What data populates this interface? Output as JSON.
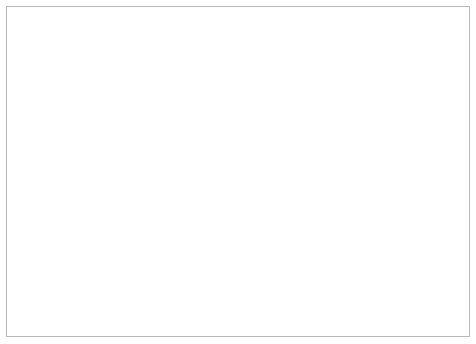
{
  "chart_data": {
    "type": "line",
    "title": "Anteil* in %",
    "xlabel": "",
    "ylabel": "",
    "ylim": [
      0,
      70
    ],
    "ytick_values": [
      0,
      10,
      20,
      30,
      40,
      50,
      60,
      70
    ],
    "xtick_labels": [
      "2003",
      "2004",
      "2005",
      "2006",
      "2007",
      "2008",
      "2009",
      "2010",
      "2011"
    ],
    "xlim": [
      2003.0,
      2011.5
    ],
    "grid": "horizontal",
    "legend": "none",
    "marker": "open-diamond",
    "line_color": "#000000",
    "grid_color": "#555555",
    "series": [
      {
        "name": "Anteil in %",
        "x": [
          2003.45,
          2003.7,
          2003.95,
          2004.2,
          2004.45,
          2004.7,
          2004.95,
          2005.2,
          2005.45,
          2005.7,
          2005.95,
          2006.2,
          2006.45,
          2006.7,
          2006.95,
          2007.2,
          2007.45,
          2007.7,
          2007.95,
          2008.2,
          2008.45,
          2008.7,
          2008.95,
          2009.05,
          2009.14,
          2009.23,
          2009.32,
          2009.41,
          2009.5,
          2009.59,
          2009.68,
          2009.77,
          2009.86,
          2009.95,
          2010.04,
          2010.13,
          2010.22,
          2010.31,
          2010.4,
          2010.49,
          2010.58,
          2010.67,
          2010.76,
          2010.85,
          2010.94,
          2011.03,
          2011.12,
          2011.21,
          2011.3,
          2011.39
        ],
        "values": [
          59.0,
          63.5,
          57.8,
          55.2,
          52.5,
          50.0,
          46.2,
          42.0,
          38.0,
          34.5,
          31.0,
          27.0,
          24.5,
          22.6,
          23.0,
          24.5,
          26.5,
          29.0,
          33.0,
          37.5,
          40.5,
          41.0,
          40.5,
          41.8,
          41.3,
          42.5,
          43.5,
          43.0,
          44.5,
          45.8,
          44.5,
          43.5,
          44.8,
          46.0,
          45.3,
          44.0,
          43.5,
          41.5,
          39.5,
          37.5,
          35.5,
          33.5,
          31.5,
          29.5,
          28.0,
          27.0,
          26.2,
          25.5,
          24.5,
          23.2
        ]
      }
    ]
  }
}
